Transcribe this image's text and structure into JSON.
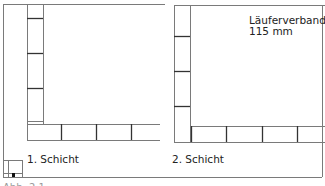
{
  "diagram": {
    "title": "Läuferverband",
    "thickness": "115 mm",
    "panels": [
      {
        "label": "1. Schicht"
      },
      {
        "label": "2. Schicht"
      }
    ],
    "footer_text": "Abb. 2.1",
    "colors": {
      "line": "#7a7a7a",
      "joint": "#333333",
      "text": "#222222",
      "background": "#ffffff"
    }
  }
}
